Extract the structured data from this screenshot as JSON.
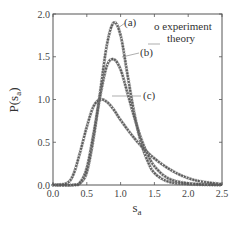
{
  "chart_data": {
    "type": "line",
    "title": "",
    "xlabel": "s_a",
    "ylabel": "P(s_a)",
    "xlim": [
      0.0,
      2.5
    ],
    "ylim": [
      0.0,
      2.0
    ],
    "xticks": [
      "0.0",
      "0.5",
      "1.0",
      "1.5",
      "2.0",
      "2.5"
    ],
    "yticks": [
      "0.0",
      "0.5",
      "1.0",
      "1.5",
      "2.0"
    ],
    "grid": false,
    "legend": {
      "position": "upper right",
      "entries": [
        "o experiment",
        "theory"
      ]
    },
    "annotations": [
      "(a)",
      "(b)",
      "(c)"
    ],
    "series": [
      {
        "name": "(a)",
        "x": [
          0.0,
          0.3,
          0.4,
          0.5,
          0.6,
          0.7,
          0.8,
          0.9,
          1.0,
          1.1,
          1.2,
          1.3,
          1.4,
          1.5,
          1.7,
          2.0,
          2.5
        ],
        "values": [
          0.0,
          0.0,
          0.02,
          0.15,
          0.55,
          1.1,
          1.65,
          1.9,
          1.75,
          1.3,
          0.85,
          0.5,
          0.28,
          0.14,
          0.04,
          0.01,
          0.0
        ]
      },
      {
        "name": "(b)",
        "x": [
          0.0,
          0.3,
          0.4,
          0.5,
          0.6,
          0.7,
          0.8,
          0.9,
          1.0,
          1.1,
          1.2,
          1.3,
          1.4,
          1.5,
          1.7,
          2.0,
          2.5
        ],
        "values": [
          0.0,
          0.0,
          0.03,
          0.2,
          0.6,
          1.05,
          1.4,
          1.47,
          1.35,
          1.08,
          0.8,
          0.55,
          0.36,
          0.22,
          0.08,
          0.02,
          0.0
        ]
      },
      {
        "name": "(c)",
        "x": [
          0.0,
          0.2,
          0.3,
          0.4,
          0.5,
          0.6,
          0.7,
          0.8,
          0.9,
          1.0,
          1.2,
          1.4,
          1.6,
          1.8,
          2.0,
          2.2,
          2.5
        ],
        "values": [
          0.0,
          0.02,
          0.12,
          0.38,
          0.68,
          0.92,
          1.0,
          0.97,
          0.88,
          0.76,
          0.55,
          0.38,
          0.25,
          0.15,
          0.08,
          0.04,
          0.01
        ]
      }
    ]
  },
  "labels": {
    "xlabel_main": "s",
    "xlabel_sub": "a",
    "ylabel": "P(s",
    "ylabel_sub": "a",
    "ylabel_close": ")",
    "legend_experiment": "o experiment",
    "legend_theory": "theory",
    "ann_a": "(a)",
    "ann_b": "(b)",
    "ann_c": "(c)"
  },
  "colors": {
    "line": "#555555",
    "marker": "#777777",
    "axis": "#555555"
  }
}
